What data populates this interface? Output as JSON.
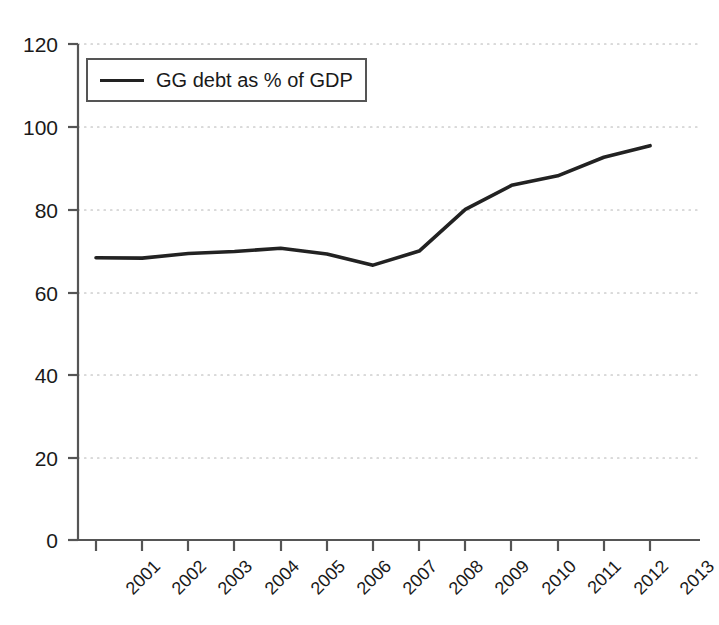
{
  "chart_data": {
    "type": "line",
    "title": "",
    "xlabel": "",
    "ylabel": "",
    "categories": [
      "2001",
      "2002",
      "2003",
      "2004",
      "2005",
      "2006",
      "2007",
      "2008",
      "2009",
      "2010",
      "2011",
      "2012",
      "2013"
    ],
    "series": [
      {
        "name": "GG debt as % of GDP",
        "values": [
          68.3,
          68.2,
          69.3,
          69.8,
          70.6,
          69.2,
          66.5,
          69.9,
          80.0,
          85.8,
          88.1,
          92.6,
          95.4
        ],
        "color": "#222222"
      }
    ],
    "ylim": [
      0,
      120
    ],
    "yticks": [
      0,
      20,
      40,
      60,
      80,
      100,
      120
    ],
    "ytick_labels": [
      "0",
      "20",
      "40",
      "60",
      "80",
      "100",
      "120"
    ],
    "grid": "horizontal-dotted",
    "legend_position": "top-left-inside",
    "legend_entries": [
      "GG debt as % of GDP"
    ],
    "xtick_rotation": -45
  },
  "legend": {
    "label": "GG debt as % of GDP"
  },
  "axes": {
    "y_label_0": "0",
    "y_label_20": "20",
    "y_label_40": "40",
    "y_label_60": "60",
    "y_label_80": "80",
    "y_label_100": "100",
    "y_label_120": "120"
  },
  "colors": {
    "line": "#222222",
    "axis": "#4d4d4d",
    "grid": "#b5b5b5",
    "text": "#1a1a1a",
    "background": "#ffffff"
  }
}
